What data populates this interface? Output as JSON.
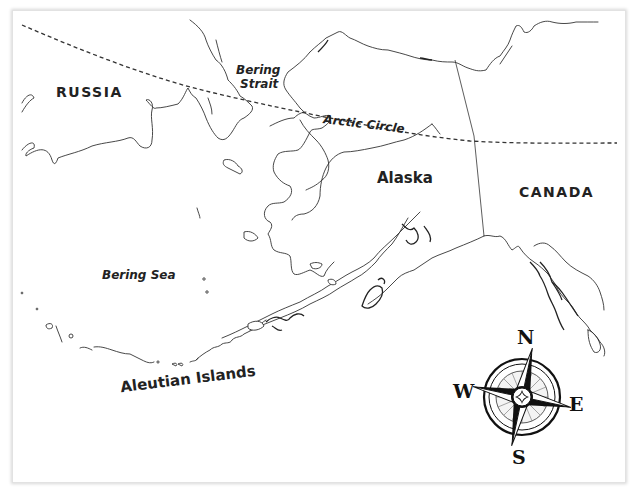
{
  "map": {
    "title": "Alaska and the Bering Strait region",
    "labels": {
      "russia": "RUSSIA",
      "canada": "CANADA",
      "alaska": "Alaska",
      "bering_strait_line1": "Bering",
      "bering_strait_line2": "Strait",
      "arctic_circle": "Arctic Circle",
      "bering_sea": "Bering Sea",
      "aleutian_islands": "Aleutian Islands"
    },
    "compass": {
      "north": "N",
      "south": "S",
      "east": "E",
      "west": "W"
    },
    "features": {
      "arctic_circle_line": "dashed",
      "international_border": "Alaska–Canada border (solid line)"
    },
    "colors": {
      "background": "#ffffff",
      "line": "#333333",
      "text": "#222222"
    }
  }
}
